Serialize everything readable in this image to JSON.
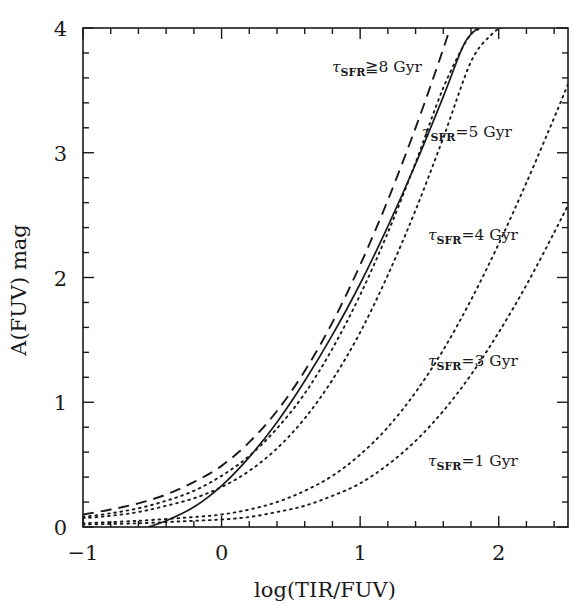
{
  "figure": {
    "kind": "scientific-plot",
    "background": "#ffffff",
    "ink": "#1a1a1a"
  },
  "chart_data": {
    "type": "line",
    "title": "",
    "xlabel": "log(TIR/FUV)",
    "ylabel": "A(FUV) mag",
    "xlim": [
      -1,
      2.5
    ],
    "ylim": [
      0,
      4
    ],
    "xticks": [
      -1,
      0,
      1,
      2
    ],
    "xticklabels": [
      "−1",
      "0",
      "1",
      "2"
    ],
    "yticks": [
      0,
      1,
      2,
      3,
      4
    ],
    "yticklabels": [
      "0",
      "1",
      "2",
      "3",
      "4"
    ],
    "minor_tick_step_x": 0.2,
    "minor_tick_step_y": 0.2,
    "grid": false,
    "legend": "inline-annotations",
    "tick_direction": "in",
    "series": [
      {
        "name": "tau_SFR >= 8 Gyr",
        "label": "τ_SFR≧8 Gyr",
        "style": "dashed",
        "x": [
          -1.0,
          -0.8,
          -0.6,
          -0.4,
          -0.2,
          0.0,
          0.2,
          0.4,
          0.6,
          0.8,
          1.0,
          1.2,
          1.4,
          1.55,
          1.65
        ],
        "y": [
          0.1,
          0.14,
          0.19,
          0.26,
          0.36,
          0.49,
          0.68,
          0.93,
          1.25,
          1.64,
          2.1,
          2.62,
          3.2,
          3.67,
          4.0
        ]
      },
      {
        "name": "empirical relation",
        "label": "",
        "style": "solid",
        "x": [
          -0.53,
          -0.4,
          -0.2,
          0.0,
          0.2,
          0.4,
          0.6,
          0.8,
          1.0,
          1.2,
          1.4,
          1.6,
          1.75,
          1.85
        ],
        "y": [
          0.0,
          0.05,
          0.16,
          0.33,
          0.56,
          0.84,
          1.17,
          1.54,
          1.95,
          2.41,
          2.91,
          3.45,
          3.87,
          4.0
        ]
      },
      {
        "name": "tau_SFR = 5 Gyr",
        "label": "τ_SFR=5 Gyr",
        "style": "dotted",
        "x": [
          -1.0,
          -0.8,
          -0.6,
          -0.4,
          -0.2,
          0.0,
          0.2,
          0.4,
          0.6,
          0.8,
          1.0,
          1.2,
          1.4,
          1.6,
          1.78,
          1.88
        ],
        "y": [
          0.08,
          0.11,
          0.15,
          0.21,
          0.29,
          0.41,
          0.57,
          0.79,
          1.07,
          1.43,
          1.86,
          2.36,
          2.92,
          3.52,
          3.92,
          4.0
        ]
      },
      {
        "name": "tau_SFR = 4 Gyr",
        "label": "τ_SFR=4 Gyr",
        "style": "dotted",
        "x": [
          -1.0,
          -0.8,
          -0.6,
          -0.4,
          -0.2,
          0.0,
          0.2,
          0.4,
          0.6,
          0.8,
          1.0,
          1.2,
          1.4,
          1.6,
          1.8,
          1.95,
          2.02
        ],
        "y": [
          0.07,
          0.09,
          0.12,
          0.17,
          0.23,
          0.32,
          0.45,
          0.63,
          0.87,
          1.18,
          1.56,
          2.02,
          2.54,
          3.12,
          3.73,
          3.95,
          4.0
        ]
      },
      {
        "name": "tau_SFR = 3 Gyr",
        "label": "τ_SFR=3 Gyr",
        "style": "dotted",
        "x": [
          -1.0,
          -0.6,
          -0.2,
          0.0,
          0.2,
          0.4,
          0.6,
          0.8,
          1.0,
          1.2,
          1.4,
          1.6,
          1.8,
          2.0,
          2.2,
          2.4,
          2.5
        ],
        "y": [
          0.03,
          0.05,
          0.08,
          0.1,
          0.14,
          0.2,
          0.29,
          0.41,
          0.58,
          0.8,
          1.08,
          1.42,
          1.82,
          2.27,
          2.76,
          3.28,
          3.55
        ]
      },
      {
        "name": "tau_SFR = 1 Gyr",
        "label": "τ_SFR=1 Gyr",
        "style": "dotted",
        "x": [
          -1.0,
          -0.6,
          -0.2,
          0.0,
          0.2,
          0.4,
          0.6,
          0.8,
          1.0,
          1.2,
          1.4,
          1.6,
          1.8,
          2.0,
          2.2,
          2.4,
          2.5
        ],
        "y": [
          0.02,
          0.03,
          0.05,
          0.06,
          0.08,
          0.12,
          0.17,
          0.25,
          0.35,
          0.5,
          0.69,
          0.93,
          1.22,
          1.56,
          1.94,
          2.36,
          2.58
        ]
      }
    ],
    "annotations": [
      {
        "id": "label-tau-ge-8",
        "tau_text": "τ",
        "sub": "SFR",
        "rest": "≧8 Gyr",
        "x_px": 332,
        "y_px": 72
      },
      {
        "id": "label-tau-5",
        "tau_text": "τ",
        "sub": "SFR",
        "rest": "=5 Gyr",
        "x_px": 422,
        "y_px": 137
      },
      {
        "id": "label-tau-4",
        "tau_text": "τ",
        "sub": "SFR",
        "rest": "=4 Gyr",
        "x_px": 428,
        "y_px": 240
      },
      {
        "id": "label-tau-3",
        "tau_text": "τ",
        "sub": "SFR",
        "rest": "=3 Gyr",
        "x_px": 428,
        "y_px": 366
      },
      {
        "id": "label-tau-1",
        "tau_text": "τ",
        "sub": "SFR",
        "rest": "=1 Gyr",
        "x_px": 428,
        "y_px": 466
      }
    ]
  }
}
